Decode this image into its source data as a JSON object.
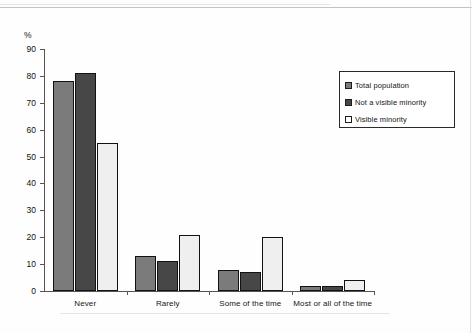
{
  "chart_data": {
    "type": "bar",
    "title": "",
    "subtitle": "",
    "xlabel": "",
    "ylabel": "%",
    "ylim": [
      0,
      90
    ],
    "yticks": [
      0,
      10,
      20,
      30,
      40,
      50,
      60,
      70,
      80,
      90
    ],
    "grid": false,
    "legend_position": "upper-right",
    "categories": [
      "Never",
      "Rarely",
      "Some of the time",
      "Most or all of the time"
    ],
    "series": [
      {
        "name": "Total population",
        "color": "#7b7b7b",
        "values": [
          78,
          13,
          8,
          2
        ]
      },
      {
        "name": "Not a visible minority",
        "color": "#474747",
        "values": [
          81,
          11,
          7,
          2
        ]
      },
      {
        "name": "Visible minority",
        "color": "#efefef",
        "values": [
          55,
          21,
          20,
          4
        ]
      }
    ]
  },
  "axis": {
    "unit_label": "%",
    "tick_labels": [
      "90",
      "80",
      "70",
      "60",
      "50",
      "40",
      "30",
      "20",
      "10",
      "0"
    ]
  },
  "legend": {
    "entries": [
      {
        "label": "Total population",
        "swatch": "legend-swatch-gray"
      },
      {
        "label": "Not a visible minority",
        "swatch": "legend-swatch-dark"
      },
      {
        "label": "Visible minority",
        "swatch": "legend-swatch-white"
      }
    ]
  }
}
